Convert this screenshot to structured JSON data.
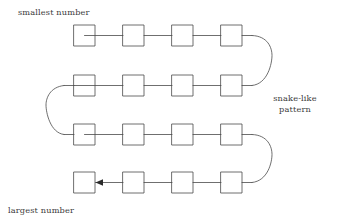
{
  "diagram": {
    "stroke_color": "#4a4a4a",
    "text_color": "#3a3a3a",
    "background_color": "#ffffff",
    "labels": {
      "smallest": "smallest number",
      "largest": "largest number",
      "snake_line1": "snake-like",
      "snake_line2": "pattern"
    },
    "grid": {
      "rows": 4,
      "columns": 4,
      "cell_size": 21,
      "column_x": [
        74,
        123,
        172,
        221
      ],
      "row_y": [
        25,
        75,
        124,
        172
      ]
    },
    "connectors": {
      "turn_right_row1_to_row2": "right U-turn",
      "turn_left_row2_to_row3": "left U-turn",
      "turn_right_row3_to_row4": "right U-turn",
      "arrow_direction": "left",
      "arrow_target": "row-4-column-1"
    }
  }
}
